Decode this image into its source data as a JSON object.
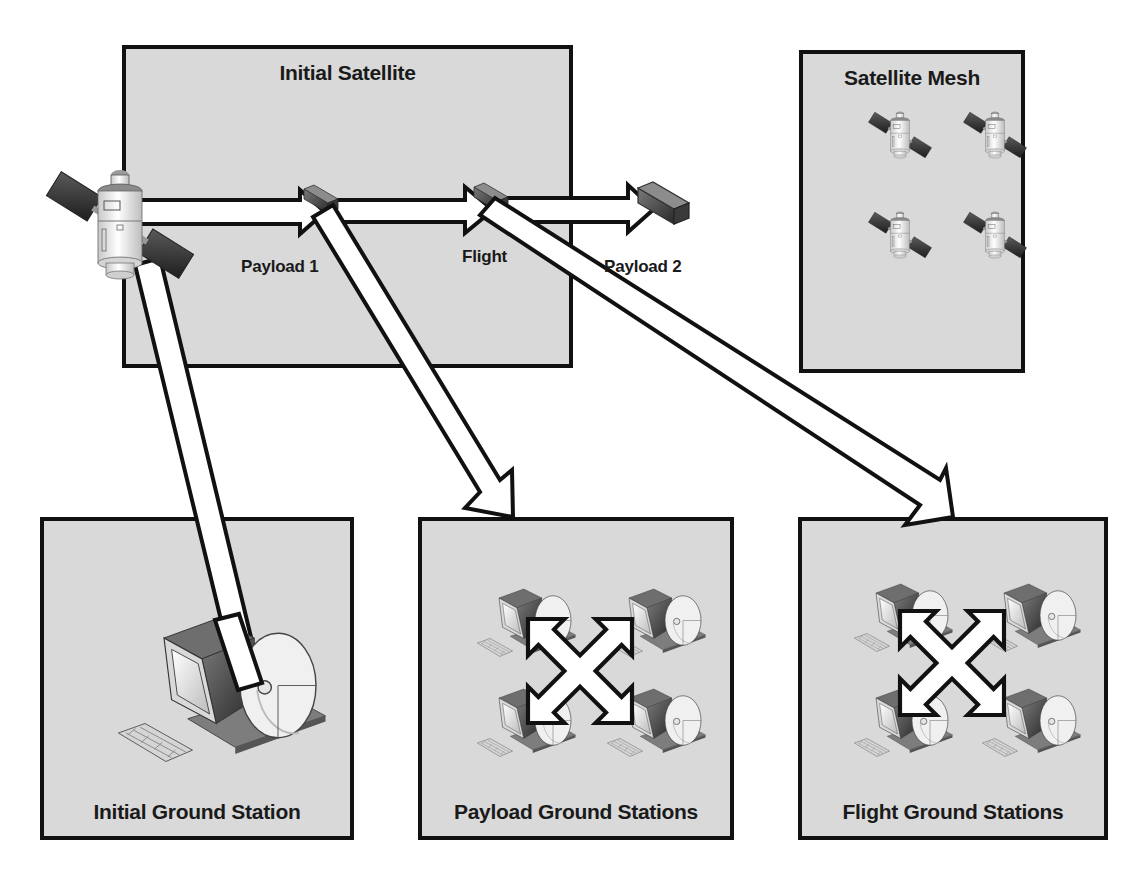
{
  "diagram": {
    "colors": {
      "box_fill": "#d9d9d9",
      "box_border": "#111111",
      "arrow_fill": "#ffffff",
      "arrow_stroke": "#111111",
      "text": "#1a1a1a"
    },
    "boxes": {
      "initial_satellite": {
        "title": "Initial Satellite"
      },
      "satellite_mesh": {
        "title": "Satellite Mesh",
        "satellite_count": 4
      },
      "initial_ground_station": {
        "title": "Initial Ground Station"
      },
      "payload_ground_stations": {
        "title": "Payload Ground Stations",
        "station_count": 4
      },
      "flight_ground_stations": {
        "title": "Flight Ground Stations",
        "station_count": 4
      }
    },
    "chain_labels": {
      "payload1": "Payload 1",
      "flight": "Flight",
      "payload2": "Payload 2"
    },
    "icons": {
      "satellite": "satellite-icon",
      "module": "satellite-module-icon",
      "ground_station": "ground-station-icon",
      "mesh": "four-way-arrow-icon"
    },
    "connections": [
      {
        "from": "Initial Satellite",
        "to": "Payload 1"
      },
      {
        "from": "Payload 1",
        "to": "Flight"
      },
      {
        "from": "Flight",
        "to": "Payload 2"
      },
      {
        "from": "Satellite",
        "to": "Initial Ground Station"
      },
      {
        "from": "Payload 1",
        "to": "Payload Ground Stations"
      },
      {
        "from": "Flight",
        "to": "Flight Ground Stations"
      }
    ]
  }
}
